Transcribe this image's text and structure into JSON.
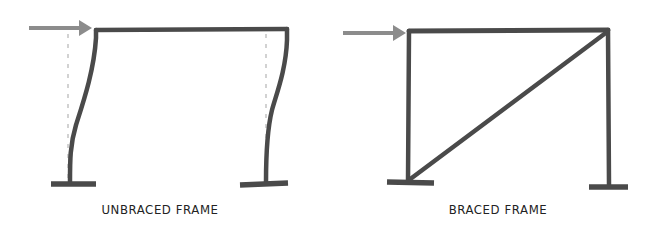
{
  "diagram": {
    "colors": {
      "member": "#4a4a4a",
      "load_arrow": "#8c8c8c",
      "undeformed_outline": "#c4c4c4",
      "label": "#222222"
    },
    "panels": [
      {
        "id": "unbraced",
        "label": "UNBRACED FRAME",
        "has_lateral_load": true,
        "has_diagonal_brace": false,
        "shows_deformed_shape": true,
        "shows_undeformed_outline": true
      },
      {
        "id": "braced",
        "label": "BRACED FRAME",
        "has_lateral_load": true,
        "has_diagonal_brace": true,
        "shows_deformed_shape": false,
        "shows_undeformed_outline": false
      }
    ]
  }
}
